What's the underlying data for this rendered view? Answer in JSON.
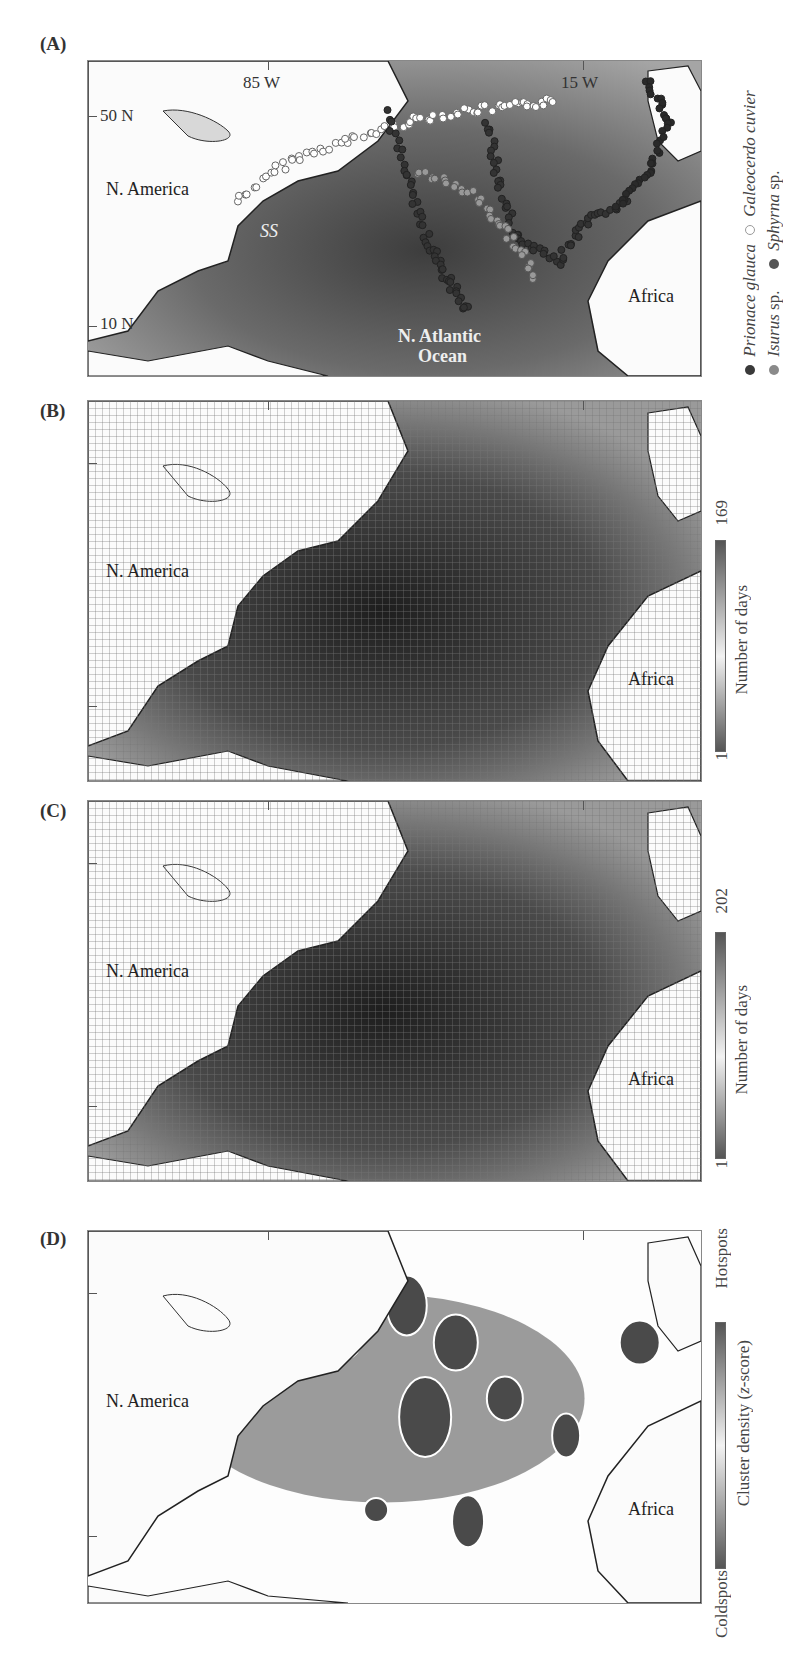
{
  "figure": {
    "panels": [
      {
        "id": "A",
        "label": "(A)",
        "coord_labels": {
          "lon_left": "85 W",
          "lon_right": "15 W",
          "lat_top": "50 N",
          "lat_bottom": "10 N"
        },
        "place_labels": {
          "continent_west": "N. America",
          "continent_east": "Africa",
          "ocean_line1": "N. Atlantic",
          "ocean_line2": "Ocean",
          "sargasso": "SS"
        },
        "legend": {
          "items": [
            {
              "name": "Prionace glauca",
              "suffix": "",
              "marker": "filled",
              "color": "#3a3a3a"
            },
            {
              "name": "Isurus",
              "suffix": " sp.",
              "marker": "filled",
              "color": "#8a8a8a"
            },
            {
              "name": "Galeocerdo cuvier",
              "suffix": "",
              "marker": "open",
              "color": "#9a9a9a"
            },
            {
              "name": "Sphyrna",
              "suffix": " sp.",
              "marker": "filled",
              "color": "#555555"
            }
          ]
        }
      },
      {
        "id": "B",
        "label": "(B)",
        "place_labels": {
          "continent_west": "N. America",
          "continent_east": "Africa"
        },
        "colorbar": {
          "title": "Number of days",
          "min": "1",
          "max": "169",
          "colors": [
            "#555555",
            "#f2f2f2",
            "#555555"
          ]
        }
      },
      {
        "id": "C",
        "label": "(C)",
        "place_labels": {
          "continent_west": "N. America",
          "continent_east": "Africa"
        },
        "colorbar": {
          "title": "Number of days",
          "min": "1",
          "max": "202",
          "colors": [
            "#555555",
            "#f2f2f2",
            "#555555"
          ]
        }
      },
      {
        "id": "D",
        "label": "(D)",
        "place_labels": {
          "continent_west": "N. America",
          "continent_east": "Africa"
        },
        "colorbar": {
          "title": "Cluster density (",
          "title_italic": "z",
          "title_end": "-score)",
          "min": "Coldspots",
          "max": "Hotspots",
          "colors": [
            "#555555",
            "#f2f2f2",
            "#555555"
          ]
        }
      }
    ]
  }
}
